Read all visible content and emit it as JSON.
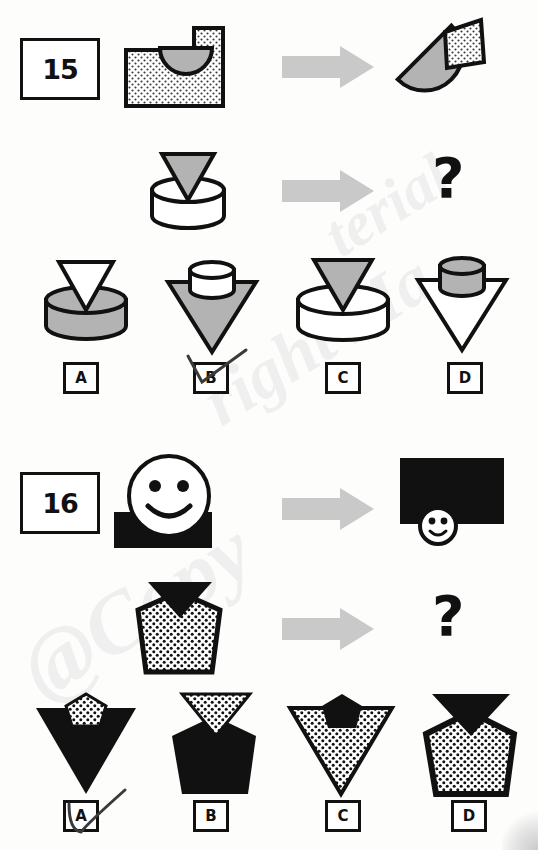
{
  "document": {
    "type": "non-verbal-reasoning-worksheet",
    "page_background": "#fdfdfc",
    "ink_color": "#111111",
    "gray_fill": "#b3b3b3",
    "arrow_color": "#c9c9c9",
    "watermark_text": "@Copyright Material",
    "watermark_parts": [
      "@Copy",
      "right Ma",
      "terial"
    ]
  },
  "questions": [
    {
      "number": "15",
      "prompt_row": {
        "source_label": "rectangle-with-circle",
        "arrow_label": "transformation-arrow",
        "result_label": "circle-with-rectangle"
      },
      "target_row": {
        "source_label": "cylinder-with-triangle",
        "arrow_label": "transformation-arrow",
        "result_label": "?"
      },
      "options": [
        {
          "letter": "A",
          "description": "gray-cylinder-with-white-triangle"
        },
        {
          "letter": "B",
          "description": "gray-triangle-with-white-cylinder"
        },
        {
          "letter": "C",
          "description": "white-cylinder-with-gray-triangle"
        },
        {
          "letter": "D",
          "description": "white-triangle-with-gray-cylinder"
        }
      ],
      "marked_option": "B"
    },
    {
      "number": "16",
      "prompt_row": {
        "source_label": "large-smiley-with-black-rectangle",
        "arrow_label": "transformation-arrow",
        "result_label": "large-black-rectangle-with-small-smiley"
      },
      "target_row": {
        "source_label": "dotted-pentagon-with-black-triangle",
        "arrow_label": "transformation-arrow",
        "result_label": "?"
      },
      "options": [
        {
          "letter": "A",
          "description": "large-black-triangle-with-small-dotted-pentagon"
        },
        {
          "letter": "B",
          "description": "black-pentagon-with-dotted-triangle"
        },
        {
          "letter": "C",
          "description": "large-dotted-triangle-with-small-black-pentagon"
        },
        {
          "letter": "D",
          "description": "dotted-pentagon-with-black-triangle-larger"
        }
      ],
      "marked_option": "A"
    }
  ],
  "symbols": {
    "question_mark": "?"
  }
}
